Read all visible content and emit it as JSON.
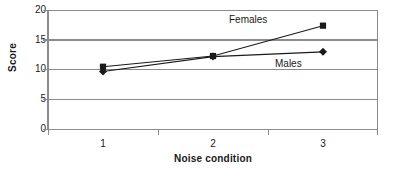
{
  "chart_data": {
    "type": "line",
    "title": "",
    "xlabel": "Noise condition",
    "ylabel": "Score",
    "categories": [
      "1",
      "2",
      "3"
    ],
    "yticks": [
      "0",
      "5",
      "10",
      "15",
      "20"
    ],
    "ylim": [
      0,
      20
    ],
    "grid": true,
    "legend_position": "inline-annotation",
    "series": [
      {
        "name": "Females",
        "marker": "square",
        "color": "#1a1a1a",
        "values": [
          10.4,
          12.2,
          17.3
        ]
      },
      {
        "name": "Males",
        "marker": "diamond",
        "color": "#1a1a1a",
        "values": [
          9.6,
          12.1,
          12.9
        ]
      }
    ],
    "annotations": [
      {
        "text": "Females",
        "series": "Females"
      },
      {
        "text": "Males",
        "series": "Males"
      }
    ]
  },
  "axes": {
    "y_title": "Score",
    "x_title": "Noise condition",
    "y_tick_labels": [
      "20",
      "15",
      "10",
      "5",
      "0"
    ],
    "x_tick_labels": [
      "1",
      "2",
      "3"
    ]
  },
  "colors": {
    "axis": "#8c8c8c",
    "grid": "#8c8c8c",
    "series": "#1a1a1a",
    "background": "#ffffff"
  }
}
